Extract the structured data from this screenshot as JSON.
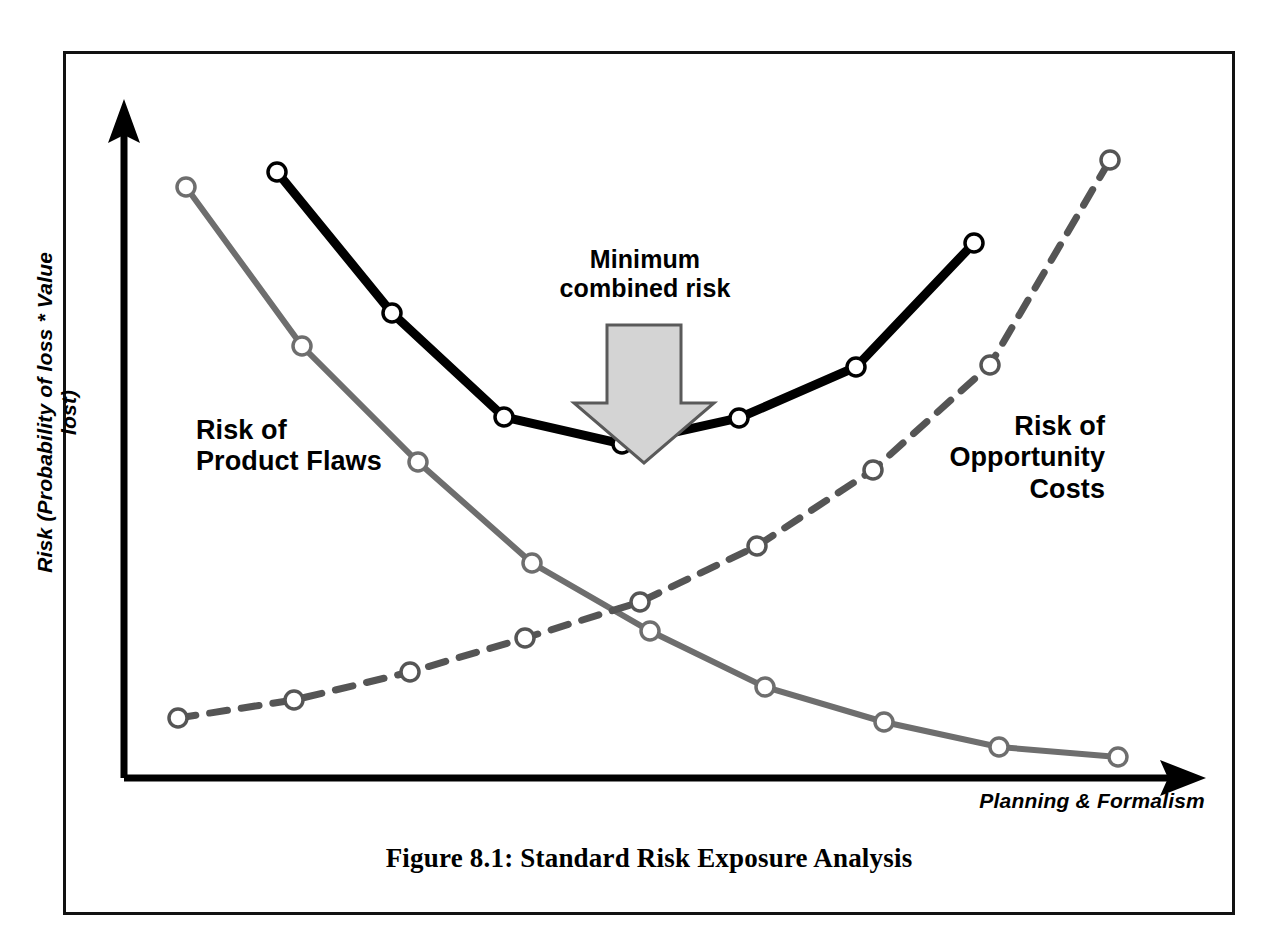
{
  "figure": {
    "caption": "Figure 8.1: Standard Risk Exposure Analysis",
    "frame": {
      "border_color": "#111111"
    }
  },
  "annotations": {
    "minimum_combined_risk": "Minimum\ncombined risk",
    "arrow_fill": "#d4d4d4",
    "arrow_stroke": "#5a5a5a"
  },
  "labels": {
    "product_flaws": "Risk of\nProduct Flaws",
    "opportunity_costs": "Risk of\nOpportunity\nCosts"
  },
  "chart_data": {
    "type": "line",
    "title": "Figure 8.1: Standard Risk Exposure Analysis",
    "xlabel": "Planning & Formalism",
    "ylabel": "Risk (Probability of loss * Value lost)",
    "grid": false,
    "legend": "inline-annotations",
    "axis_style": "arrows",
    "xlim": [
      0,
      10
    ],
    "ylim": [
      0,
      10
    ],
    "axes": {
      "x_axis_arrow": true,
      "y_axis_arrow": true,
      "x_tick_labels": [],
      "y_tick_labels": []
    },
    "series": [
      {
        "name": "Risk of Product Flaws",
        "style": "solid",
        "color": "#6e6e6e",
        "width": 6,
        "marker": "open-circle",
        "points": [
          {
            "x": 186,
            "y": 187
          },
          {
            "x": 302,
            "y": 346
          },
          {
            "x": 418,
            "y": 462
          },
          {
            "x": 532,
            "y": 563
          },
          {
            "x": 650,
            "y": 631
          },
          {
            "x": 765,
            "y": 687
          },
          {
            "x": 884,
            "y": 722
          },
          {
            "x": 999,
            "y": 747
          },
          {
            "x": 1118,
            "y": 757
          }
        ],
        "values": [
          8.9,
          7.3,
          6.1,
          5.1,
          4.4,
          3.8,
          3.5,
          3.2,
          3.1
        ]
      },
      {
        "name": "Combined risk",
        "style": "solid",
        "color": "#000000",
        "width": 9,
        "marker": "open-circle",
        "points": [
          {
            "x": 277,
            "y": 172
          },
          {
            "x": 392,
            "y": 313
          },
          {
            "x": 504,
            "y": 417
          },
          {
            "x": 622,
            "y": 444
          },
          {
            "x": 739,
            "y": 418
          },
          {
            "x": 856,
            "y": 367
          },
          {
            "x": 974,
            "y": 243
          }
        ],
        "values": [
          9.1,
          7.6,
          6.5,
          6.2,
          6.5,
          7.0,
          8.3
        ]
      },
      {
        "name": "Risk of Opportunity Costs",
        "style": "dashed",
        "color": "#555555",
        "width": 7,
        "dash": "18 14",
        "marker": "open-circle",
        "points": [
          {
            "x": 178,
            "y": 718
          },
          {
            "x": 294,
            "y": 700
          },
          {
            "x": 410,
            "y": 672
          },
          {
            "x": 525,
            "y": 638
          },
          {
            "x": 640,
            "y": 602
          },
          {
            "x": 757,
            "y": 546
          },
          {
            "x": 873,
            "y": 470
          },
          {
            "x": 990,
            "y": 365
          },
          {
            "x": 1110,
            "y": 160
          }
        ],
        "values": [
          2.8,
          3.0,
          3.3,
          3.6,
          4.0,
          4.6,
          5.4,
          6.5,
          8.7
        ]
      }
    ],
    "annotations": [
      {
        "text": "Minimum combined risk",
        "points_to": "combined-risk-minimum",
        "x": 622,
        "y": 444
      }
    ]
  }
}
